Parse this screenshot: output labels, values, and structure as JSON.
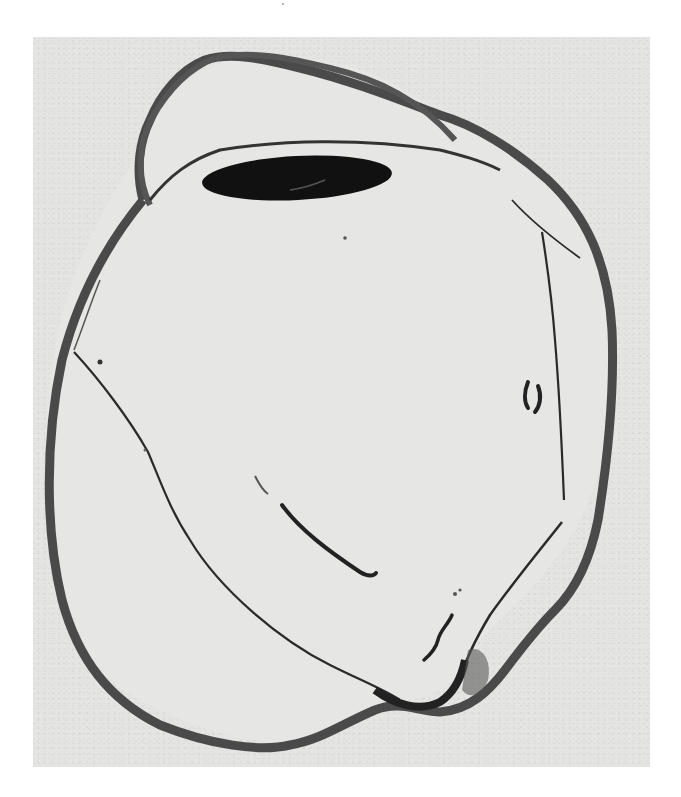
{
  "figure": {
    "kind": "scanned histological photomicrograph",
    "text_labels": [],
    "colors": {
      "page_background": "#ffffff",
      "plate_background": "#e4e4e2",
      "tissue_outer_wall": "#4a4a4a",
      "tissue_thin_lines": "#2a2a2a",
      "lens": "#111111",
      "interior": "#e6e6e4"
    },
    "plate_bounds": {
      "x": 33,
      "y": 37,
      "width": 617,
      "height": 730
    },
    "regions": [
      {
        "name": "sclera-outer-wall"
      },
      {
        "name": "cornea-anterior-chamber"
      },
      {
        "name": "lens"
      },
      {
        "name": "detached-retina-left"
      },
      {
        "name": "detached-retina-right"
      },
      {
        "name": "optic-nerve-head"
      },
      {
        "name": "vitreous-strand"
      }
    ]
  }
}
